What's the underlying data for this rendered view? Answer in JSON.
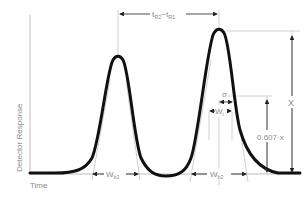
{
  "diagram": {
    "axes": {
      "y_label": "Detector Response",
      "x_label": "Time"
    },
    "annotations": {
      "retention_diff": {
        "main": "t",
        "sub1": "R2",
        "minus": "−t",
        "sub2": "R1"
      },
      "sigma": "σ",
      "wi": {
        "main": "W",
        "sub": "i"
      },
      "x": "X",
      "fraction": "0.607·x",
      "wb1": {
        "main": "W",
        "sub": "b1"
      },
      "wb2": {
        "main": "W",
        "sub": "b2"
      }
    },
    "peaks": [
      {
        "name": "peak-1",
        "center_x": 118,
        "apex_y": 57
      },
      {
        "name": "peak-2",
        "center_x": 220,
        "apex_y": 32
      }
    ],
    "colors": {
      "curve": "#111111",
      "guide": "#bbbbbb",
      "text": "#8a8a8a",
      "arrow": "#222222"
    }
  }
}
